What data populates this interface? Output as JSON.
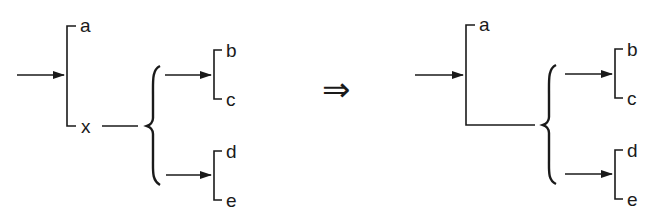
{
  "diagram": {
    "left": {
      "labels": {
        "a": "a",
        "x": "x",
        "b": "b",
        "c": "c",
        "d": "d",
        "e": "e"
      }
    },
    "transform_symbol": "⇒",
    "right": {
      "labels": {
        "a": "a",
        "b": "b",
        "c": "c",
        "d": "d",
        "e": "e"
      }
    },
    "colors": {
      "ink": "#1a1a1a",
      "background": "#ffffff"
    }
  }
}
